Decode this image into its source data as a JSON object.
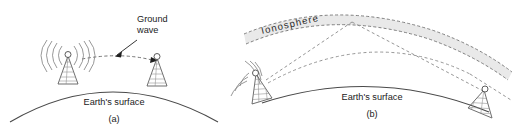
{
  "figure": {
    "title_visible": false,
    "background_color": "#ffffff",
    "panels": [
      {
        "id": "a",
        "caption": "(a)",
        "surface_label": "Earth's surface",
        "annotation": {
          "line1": "Ground",
          "line2": "wave",
          "name": "ground-wave"
        },
        "antennas": [
          {
            "role": "transmitter",
            "has_radiation_waves": true
          },
          {
            "role": "receiver",
            "has_radiation_waves": false
          }
        ],
        "propagation": "ground wave travelling along the Earth's surface between two towers"
      },
      {
        "id": "b",
        "caption": "(b)",
        "surface_label": "Earth's surface",
        "layer_label": "Ionosphere",
        "antennas": [
          {
            "role": "transmitter",
            "has_radiation_waves": true
          },
          {
            "role": "receiver",
            "has_radiation_waves": false
          }
        ],
        "propagation": "sky wave reflected from the ionosphere back to a distant receiver, plus a ray escaping through the ionosphere"
      }
    ],
    "colors": {
      "earth_stroke": "#4a4a4a",
      "ray_stroke": "#6f6f6f",
      "ionosphere_fill": "#e9e9e9",
      "ionosphere_edge": "#6a6a6a",
      "text": "#1b1b1b"
    }
  }
}
